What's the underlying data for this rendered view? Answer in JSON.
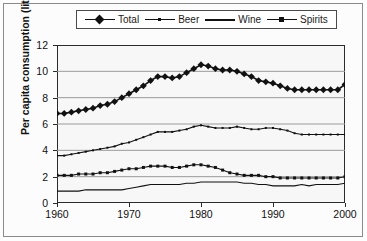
{
  "chart_data": {
    "type": "line",
    "title": "",
    "xlabel": "",
    "ylabel": "Per capita consumption (litres)",
    "xlim": [
      1960,
      2000
    ],
    "ylim": [
      0,
      12
    ],
    "grid": true,
    "legend_position": "top-center",
    "x_ticks": [
      "1960",
      "1970",
      "1980",
      "1990",
      "2000"
    ],
    "y_ticks": [
      "0",
      "2",
      "4",
      "6",
      "8",
      "10",
      "12"
    ],
    "x": [
      1960,
      1961,
      1962,
      1963,
      1964,
      1965,
      1966,
      1967,
      1968,
      1969,
      1970,
      1971,
      1972,
      1973,
      1974,
      1975,
      1976,
      1977,
      1978,
      1979,
      1980,
      1981,
      1982,
      1983,
      1984,
      1985,
      1986,
      1987,
      1988,
      1989,
      1990,
      1991,
      1992,
      1993,
      1994,
      1995,
      1996,
      1997,
      1998,
      1999,
      2000
    ],
    "series": [
      {
        "name": "Total",
        "marker": "diamond",
        "values": [
          6.8,
          6.8,
          6.9,
          7.0,
          7.1,
          7.2,
          7.4,
          7.5,
          7.7,
          8.0,
          8.3,
          8.6,
          8.9,
          9.3,
          9.6,
          9.6,
          9.5,
          9.6,
          9.9,
          10.2,
          10.5,
          10.4,
          10.2,
          10.1,
          10.1,
          10.0,
          9.8,
          9.6,
          9.3,
          9.2,
          9.1,
          8.9,
          8.7,
          8.6,
          8.6,
          8.6,
          8.6,
          8.6,
          8.6,
          8.6,
          9.0
        ]
      },
      {
        "name": "Beer",
        "marker": "small-dot",
        "values": [
          3.6,
          3.6,
          3.7,
          3.8,
          3.9,
          4.0,
          4.1,
          4.2,
          4.3,
          4.5,
          4.6,
          4.8,
          5.0,
          5.2,
          5.4,
          5.4,
          5.4,
          5.5,
          5.6,
          5.8,
          5.9,
          5.8,
          5.7,
          5.7,
          5.7,
          5.8,
          5.7,
          5.6,
          5.6,
          5.7,
          5.7,
          5.6,
          5.5,
          5.3,
          5.2,
          5.2,
          5.2,
          5.2,
          5.2,
          5.2,
          5.2
        ]
      },
      {
        "name": "Wine",
        "marker": "line",
        "values": [
          0.9,
          0.9,
          0.9,
          0.9,
          1.0,
          1.0,
          1.0,
          1.0,
          1.0,
          1.0,
          1.1,
          1.2,
          1.3,
          1.4,
          1.4,
          1.4,
          1.4,
          1.4,
          1.5,
          1.5,
          1.6,
          1.6,
          1.6,
          1.6,
          1.6,
          1.6,
          1.5,
          1.5,
          1.4,
          1.4,
          1.3,
          1.3,
          1.3,
          1.3,
          1.4,
          1.3,
          1.4,
          1.4,
          1.4,
          1.4,
          1.5
        ]
      },
      {
        "name": "Spirits",
        "marker": "square",
        "values": [
          2.1,
          2.1,
          2.1,
          2.2,
          2.2,
          2.2,
          2.3,
          2.3,
          2.4,
          2.5,
          2.6,
          2.6,
          2.7,
          2.8,
          2.8,
          2.8,
          2.7,
          2.7,
          2.8,
          2.9,
          2.9,
          2.8,
          2.7,
          2.5,
          2.3,
          2.2,
          2.1,
          2.1,
          2.1,
          2.0,
          2.0,
          1.9,
          1.9,
          1.9,
          1.9,
          1.9,
          1.9,
          1.9,
          1.9,
          1.9,
          2.0
        ]
      }
    ]
  },
  "legend": {
    "items": [
      {
        "label": "Total",
        "marker": "diamond"
      },
      {
        "label": "Beer",
        "marker": "small-dot"
      },
      {
        "label": "Wine",
        "marker": "line"
      },
      {
        "label": "Spirits",
        "marker": "square"
      }
    ]
  },
  "colors": {
    "series": "#111111",
    "grid": "#9a9a9a",
    "axis": "#2b2b2b",
    "plot_background": "#f7f7f7",
    "figure_background": "#fcfcfc"
  }
}
